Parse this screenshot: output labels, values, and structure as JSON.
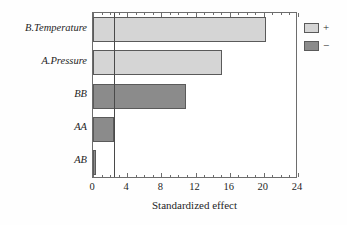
{
  "chart_data": {
    "type": "bar",
    "orientation": "horizontal",
    "title": "",
    "xlabel": "Standardized effect",
    "ylabel": "",
    "xlim": [
      0,
      24
    ],
    "xticks": [
      0,
      4,
      8,
      12,
      16,
      20,
      24
    ],
    "xtick_labels": [
      "0",
      "4",
      "8",
      "12",
      "16",
      "20",
      "24"
    ],
    "minor_tick_step": 1,
    "grid": false,
    "reference_line": {
      "value": 2.45,
      "label": ""
    },
    "categories": [
      "B.Temperature",
      "A.Pressure",
      "BB",
      "AA",
      "AB"
    ],
    "values": [
      20.3,
      15.1,
      10.9,
      2.4,
      0.4
    ],
    "signs": [
      "+",
      "+",
      "-",
      "-",
      "-"
    ],
    "series": [
      {
        "name": "+",
        "color": "#d5d5d5"
      },
      {
        "name": "-",
        "color": "#8b8b8b"
      }
    ],
    "legend": {
      "position": "right",
      "entries": [
        {
          "label": "+",
          "color": "#d5d5d5"
        },
        {
          "label": "−",
          "color": "#8b8b8b"
        }
      ]
    }
  },
  "axis": {
    "x_title": "Standardized effect",
    "tick_labels": [
      "0",
      "4",
      "8",
      "12",
      "16",
      "20",
      "24"
    ]
  },
  "bars": [
    {
      "label": "B.Temperature",
      "value": 20.3,
      "sign": "+"
    },
    {
      "label": "A.Pressure",
      "value": 15.1,
      "sign": "+"
    },
    {
      "label": "BB",
      "value": 10.9,
      "sign": "-"
    },
    {
      "label": "AA",
      "value": 2.4,
      "sign": "-"
    },
    {
      "label": "AB",
      "value": 0.4,
      "sign": "-"
    }
  ],
  "legend": {
    "positive_label": "+",
    "negative_label": "−"
  }
}
